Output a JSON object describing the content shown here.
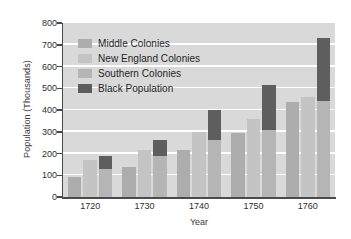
{
  "chart_data": {
    "type": "bar",
    "title": "",
    "xlabel": "Year",
    "ylabel": "Population (Thousands)",
    "categories": [
      "1720",
      "1730",
      "1740",
      "1750",
      "1760"
    ],
    "ylim": [
      0,
      800
    ],
    "yticks": [
      0,
      100,
      200,
      300,
      400,
      500,
      600,
      700,
      800
    ],
    "ytick_labels": [
      "0",
      "100",
      "200",
      "300",
      "400",
      "500",
      "600",
      "700",
      "800"
    ],
    "grid": true,
    "legend_position": "upper left",
    "stacked_third_bar": true,
    "series": [
      {
        "name": "Middle Colonies",
        "color": "#adadad",
        "values": [
          93,
          138,
          217,
          296,
          435
        ]
      },
      {
        "name": "New England Colonies",
        "color": "#c4c4c4",
        "values": [
          170,
          215,
          298,
          360,
          460
        ]
      },
      {
        "name": "Southern Colonies",
        "color": "#b5b5b5",
        "values": [
          130,
          190,
          260,
          310,
          440
        ]
      },
      {
        "name": "Black Population",
        "color": "#5e5e5e",
        "values": [
          60,
          72,
          138,
          205,
          292
        ]
      }
    ],
    "third_bar_totals": [
      190,
      262,
      398,
      515,
      732
    ],
    "plot_background": "#d9d9d9",
    "gridline_color": "#ffffff",
    "axis_color": "#4a4a4a"
  },
  "legend": {
    "items": [
      {
        "label": "Middle Colonies",
        "color": "#adadad"
      },
      {
        "label": "New England Colonies",
        "color": "#c4c4c4"
      },
      {
        "label": "Southern Colonies",
        "color": "#b5b5b5"
      },
      {
        "label": "Black Population",
        "color": "#5e5e5e"
      }
    ]
  }
}
